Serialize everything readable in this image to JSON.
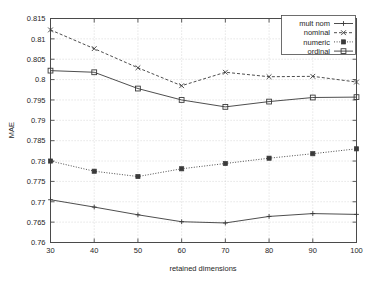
{
  "chart_data": {
    "type": "line",
    "title": "",
    "xlabel": "retained dimensions",
    "ylabel": "MAE",
    "x": [
      30,
      40,
      50,
      60,
      70,
      80,
      90,
      100
    ],
    "xlim": [
      30,
      100
    ],
    "ylim": [
      0.76,
      0.815
    ],
    "xticks": [
      "30",
      "40",
      "50",
      "60",
      "70",
      "80",
      "90",
      "100"
    ],
    "yticks": [
      "0.76",
      "0.765",
      "0.77",
      "0.775",
      "0.78",
      "0.785",
      "0.79",
      "0.795",
      "0.8",
      "0.805",
      "0.81",
      "0.815"
    ],
    "grid": true,
    "legend_position": "top-right",
    "series": [
      {
        "name": "mult nom",
        "marker": "plus",
        "linestyle": "solid",
        "values": [
          0.7705,
          0.7687,
          0.7668,
          0.7651,
          0.7648,
          0.7664,
          0.7671,
          0.7669
        ]
      },
      {
        "name": "nominal",
        "marker": "cross",
        "linestyle": "dashed",
        "values": [
          0.8122,
          0.8076,
          0.8029,
          0.7985,
          0.8018,
          0.8007,
          0.8008,
          0.7994
        ]
      },
      {
        "name": "numeric",
        "marker": "filled-square",
        "linestyle": "dotted",
        "values": [
          0.78,
          0.7775,
          0.7762,
          0.7781,
          0.7794,
          0.7807,
          0.7818,
          0.783
        ]
      },
      {
        "name": "ordinal",
        "marker": "open-square",
        "linestyle": "solid",
        "values": [
          0.8022,
          0.8018,
          0.7978,
          0.795,
          0.7933,
          0.7946,
          0.7956,
          0.7957
        ]
      }
    ]
  },
  "legend": {
    "entries": [
      {
        "label": "mult nom"
      },
      {
        "label": "nominal"
      },
      {
        "label": "numeric"
      },
      {
        "label": "ordinal"
      }
    ]
  },
  "axes": {
    "y_axis_title": "MAE",
    "x_axis_title": "retained dimensions"
  }
}
